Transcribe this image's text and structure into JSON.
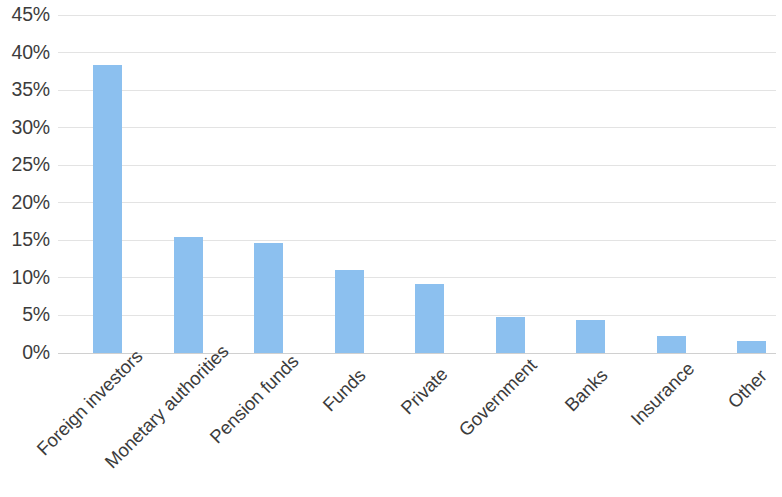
{
  "chart_data": {
    "type": "bar",
    "title": "",
    "subtitle": "",
    "xlabel": "",
    "ylabel": "",
    "categories": [
      "Foreign investors",
      "Monetary authorities",
      "Pension funds",
      "Funds",
      "Private",
      "Government",
      "Banks",
      "Insurance",
      "Other"
    ],
    "values": [
      38.4,
      15.5,
      14.6,
      11.1,
      9.2,
      4.8,
      4.4,
      2.3,
      1.6
    ],
    "value_labels": [
      "38.4%",
      "15.5%",
      "14.6%",
      "11.1%",
      "9.2%",
      "4.8%",
      "4.4%",
      "2.3%",
      "1.6%"
    ],
    "ylim": [
      0,
      45
    ],
    "ytick_values": [
      0,
      5,
      10,
      15,
      20,
      25,
      30,
      35,
      40,
      45
    ],
    "ytick_labels": [
      "0%",
      "5%",
      "10%",
      "15%",
      "20%",
      "25%",
      "30%",
      "35%",
      "40%",
      "45%"
    ],
    "grid": true,
    "grid_axis": "y",
    "legend": false,
    "legend_position": "none",
    "series": [
      {
        "name": "Share",
        "color": "#8CC0EF",
        "values": [
          38.4,
          15.5,
          14.6,
          11.1,
          9.2,
          4.8,
          4.4,
          2.3,
          1.6
        ]
      }
    ],
    "colors": {
      "bar": "#8CC0EF",
      "gridline": "#e3e3e3",
      "baseline": "#d0d0d0",
      "text": "#3c3c3c",
      "background": "#ffffff"
    },
    "xtick_rotation": -45
  }
}
